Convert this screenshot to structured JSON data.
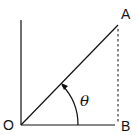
{
  "diagram": {
    "type": "angle-geometry",
    "labels": {
      "origin": "O",
      "point_a": "A",
      "point_b": "B",
      "angle": "θ"
    },
    "colors": {
      "stroke": "#111111",
      "background": "#ffffff"
    }
  }
}
